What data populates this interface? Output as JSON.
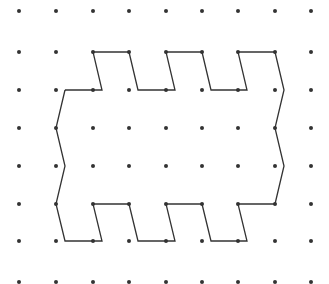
{
  "diagram": {
    "type": "dot-grid-polygon",
    "grid": {
      "columns_x": [
        19,
        56,
        93,
        129,
        166,
        202,
        238,
        275,
        311
      ],
      "rows_y": [
        11,
        52,
        90,
        128,
        166,
        204,
        241,
        282
      ],
      "dot_radius": 2,
      "dot_color": "#333333"
    },
    "shape": {
      "stroke_color": "#333333",
      "stroke_width": 1.3,
      "vertices": [
        [
          65,
          90
        ],
        [
          102,
          90
        ],
        [
          93,
          52
        ],
        [
          129,
          52
        ],
        [
          138,
          90
        ],
        [
          175,
          90
        ],
        [
          166,
          52
        ],
        [
          202,
          52
        ],
        [
          211,
          90
        ],
        [
          247,
          90
        ],
        [
          238,
          52
        ],
        [
          275,
          52
        ],
        [
          284,
          90
        ],
        [
          275,
          128
        ],
        [
          284,
          166
        ],
        [
          275,
          204
        ],
        [
          238,
          204
        ],
        [
          247,
          241
        ],
        [
          211,
          241
        ],
        [
          202,
          204
        ],
        [
          166,
          204
        ],
        [
          175,
          241
        ],
        [
          138,
          241
        ],
        [
          129,
          204
        ],
        [
          93,
          204
        ],
        [
          102,
          241
        ],
        [
          65,
          241
        ],
        [
          56,
          204
        ],
        [
          65,
          166
        ],
        [
          56,
          128
        ],
        [
          65,
          90
        ]
      ]
    }
  }
}
